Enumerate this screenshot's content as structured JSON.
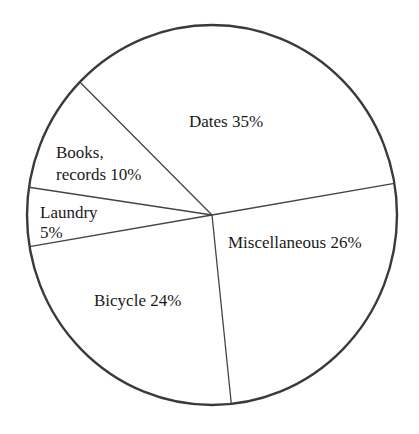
{
  "chart_data": {
    "type": "pie",
    "title": "",
    "start_boundary_category": "Dates",
    "slices": [
      {
        "label": "Dates",
        "value": 35,
        "label_lines": [
          "Dates 35%"
        ]
      },
      {
        "label": "Miscellaneous",
        "value": 26,
        "label_lines": [
          "Miscellaneous 26%"
        ]
      },
      {
        "label": "Bicycle",
        "value": 24,
        "label_lines": [
          "Bicycle 24%"
        ]
      },
      {
        "label": "Laundry",
        "value": 5,
        "label_lines": [
          "Laundry",
          "5%"
        ]
      },
      {
        "label": "Books, records",
        "value": 10,
        "label_lines": [
          "Books,",
          "records 10%"
        ]
      }
    ],
    "units": "percent",
    "legend": "none",
    "colors": {
      "fill": "#ffffff",
      "stroke": "#3a3a3a",
      "text": "#1a1a1a"
    }
  }
}
